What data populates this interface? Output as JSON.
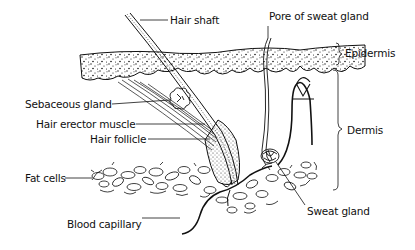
{
  "diagram": {
    "colors": {
      "ink": "#111111",
      "background": "#ffffff"
    },
    "labels": {
      "hair_shaft": "Hair shaft",
      "pore_of_sweat_gland": "Pore of sweat gland",
      "epidermis": "Epidermis",
      "sebaceous_gland": "Sebaceous gland",
      "hair_erector_muscle": "Hair erector muscle",
      "hair_follicle": "Hair follicle",
      "dermis": "Dermis",
      "fat_cells": "Fat cells",
      "sweat_gland": "Sweat gland",
      "blood_capillary": "Blood capillary"
    },
    "layers": [
      "Epidermis",
      "Dermis",
      "Fat cells (subcutaneous)"
    ]
  }
}
